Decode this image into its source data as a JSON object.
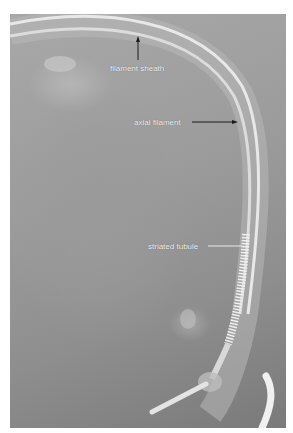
{
  "figure": {
    "labels": {
      "filament_sheath": "filament sheath",
      "axial_filament": "axial filament",
      "striated_tubule": "striated tubule"
    },
    "colors": {
      "background": "#ffffff",
      "photo_mid": "#9c9c9c",
      "filament": "#e6e6e6",
      "label_text": "#f4f4f4",
      "arrow": "#1a1a1a"
    }
  }
}
